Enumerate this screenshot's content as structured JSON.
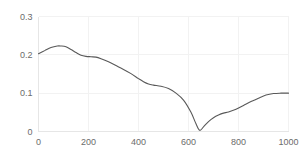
{
  "chart_data": {
    "type": "line",
    "title": "",
    "subtitle": "",
    "xlabel": "",
    "ylabel": "",
    "xlim": [
      0,
      1000
    ],
    "ylim": [
      0,
      0.3
    ],
    "grid": true,
    "legend": false,
    "legend_position": "none",
    "line_color": "#595959",
    "gridline_color": "#f2f2f2",
    "axis_color": "#e6e6e6",
    "background_color": "#ffffff",
    "x_ticks": [
      0,
      200,
      400,
      600,
      800,
      1000
    ],
    "x_tick_labels": [
      "0",
      "200",
      "400",
      "600",
      "800",
      "1000"
    ],
    "y_ticks": [
      0,
      0.1,
      0.2,
      0.3
    ],
    "y_tick_labels": [
      "0",
      "0.1",
      "0.2",
      "0.3"
    ],
    "series": [
      {
        "name": "series-1",
        "x": [
          0,
          25,
          50,
          75,
          90,
          110,
          130,
          150,
          170,
          190,
          210,
          230,
          250,
          280,
          310,
          340,
          370,
          400,
          420,
          440,
          460,
          490,
          520,
          550,
          580,
          610,
          630,
          645,
          660,
          680,
          700,
          720,
          740,
          760,
          790,
          820,
          850,
          880,
          910,
          940,
          970,
          1000
        ],
        "values": [
          0.203,
          0.211,
          0.219,
          0.223,
          0.223,
          0.221,
          0.214,
          0.206,
          0.199,
          0.196,
          0.195,
          0.194,
          0.19,
          0.182,
          0.172,
          0.162,
          0.151,
          0.138,
          0.13,
          0.124,
          0.121,
          0.118,
          0.112,
          0.1,
          0.082,
          0.05,
          0.02,
          0.003,
          0.012,
          0.026,
          0.036,
          0.043,
          0.048,
          0.051,
          0.058,
          0.068,
          0.078,
          0.087,
          0.095,
          0.099,
          0.1,
          0.1
        ]
      }
    ]
  }
}
